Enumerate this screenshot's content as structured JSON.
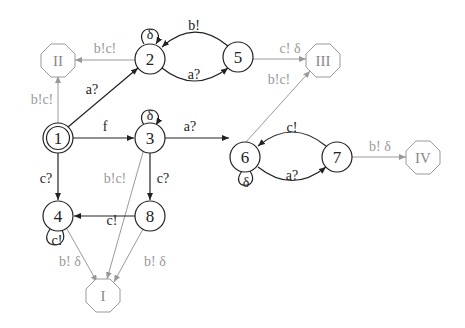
{
  "diagram": {
    "type": "state-machine",
    "colors": {
      "dark": "#222222",
      "light": "#9a9a9a",
      "background": "#ffffff"
    },
    "states": [
      {
        "id": "1",
        "label": "1",
        "initial": true
      },
      {
        "id": "2",
        "label": "2"
      },
      {
        "id": "3",
        "label": "3"
      },
      {
        "id": "4",
        "label": "4"
      },
      {
        "id": "5",
        "label": "5"
      },
      {
        "id": "6",
        "label": "6"
      },
      {
        "id": "7",
        "label": "7"
      },
      {
        "id": "8",
        "label": "8"
      }
    ],
    "terminals": [
      {
        "id": "I",
        "label": "I"
      },
      {
        "id": "II",
        "label": "II"
      },
      {
        "id": "III",
        "label": "III"
      },
      {
        "id": "IV",
        "label": "IV"
      }
    ],
    "edges": [
      {
        "from": "1",
        "to": "II",
        "label": "b!c!"
      },
      {
        "from": "2",
        "to": "II",
        "label": "b!c!"
      },
      {
        "from": "1",
        "to": "2",
        "label": "a?"
      },
      {
        "from": "2",
        "to": "2",
        "label": "δ"
      },
      {
        "from": "5",
        "to": "2",
        "label": "b!"
      },
      {
        "from": "2",
        "to": "5",
        "label": "a?"
      },
      {
        "from": "5",
        "to": "III",
        "label": "c! δ"
      },
      {
        "from": "6",
        "to": "III",
        "label": "b!c!"
      },
      {
        "from": "1",
        "to": "3",
        "label": "f"
      },
      {
        "from": "3",
        "to": "3",
        "label": "δ"
      },
      {
        "from": "3",
        "to": "6",
        "label": "a?"
      },
      {
        "from": "7",
        "to": "6",
        "label": "c!"
      },
      {
        "from": "6",
        "to": "7",
        "label": "a?"
      },
      {
        "from": "6",
        "to": "6",
        "label": "δ"
      },
      {
        "from": "7",
        "to": "IV",
        "label": "b! δ"
      },
      {
        "from": "1",
        "to": "4",
        "label": "c?"
      },
      {
        "from": "3",
        "to": "8",
        "label": "c?"
      },
      {
        "from": "3",
        "to": "I",
        "label": "b!c!"
      },
      {
        "from": "8",
        "to": "4",
        "label": "c!"
      },
      {
        "from": "4",
        "to": "4",
        "label": "c!"
      },
      {
        "from": "4",
        "to": "I",
        "label": "b! δ"
      },
      {
        "from": "8",
        "to": "I",
        "label": "b! δ"
      }
    ]
  }
}
